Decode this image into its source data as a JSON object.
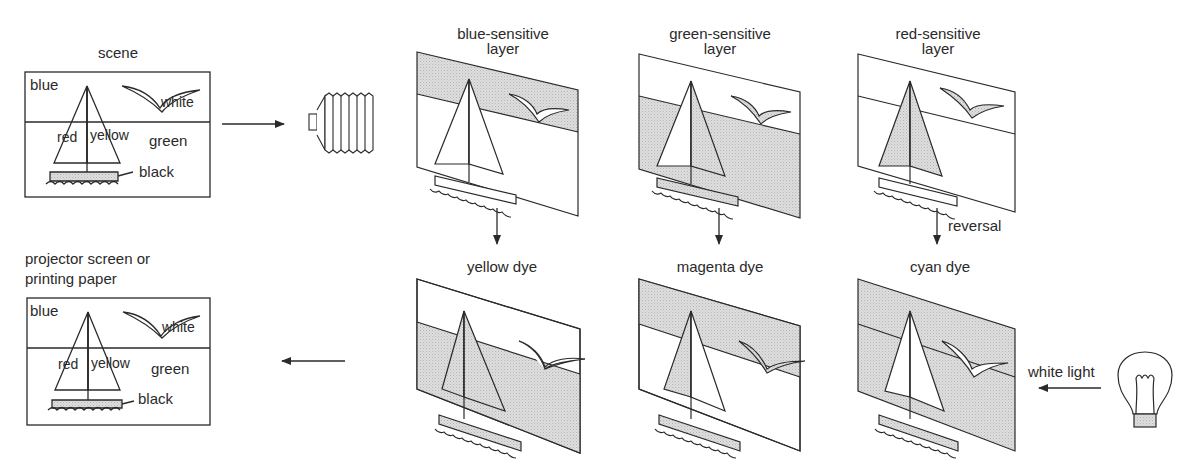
{
  "scene": {
    "heading": "scene",
    "labels": {
      "sky": "blue",
      "bird": "white",
      "left_sail": "red",
      "right_sail": "yellow",
      "sea": "green",
      "hull": "black"
    }
  },
  "output": {
    "heading_line1": "projector screen or",
    "heading_line2": "printing paper",
    "labels": {
      "sky": "blue",
      "bird": "white",
      "left_sail": "red",
      "right_sail": "yellow",
      "sea": "green",
      "hull": "black"
    }
  },
  "layers": [
    {
      "title_line1": "blue-sensitive",
      "title_line2": "layer",
      "dye": "yellow dye",
      "arrow_note": ""
    },
    {
      "title_line1": "green-sensitive",
      "title_line2": "layer",
      "dye": "magenta dye",
      "arrow_note": ""
    },
    {
      "title_line1": "red-sensitive",
      "title_line2": "layer",
      "dye": "cyan dye",
      "arrow_note": "reversal"
    }
  ],
  "light": {
    "label": "white light",
    "icon": "light-bulb-icon"
  },
  "camera": {
    "icon": "camera-bellows-icon"
  },
  "colors": {
    "line": "#2a2a2a",
    "shade": "#d4d4d4",
    "background": "#ffffff"
  }
}
